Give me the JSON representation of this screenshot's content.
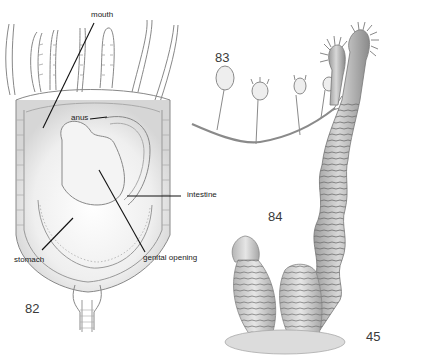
{
  "figure": {
    "background": "#ffffff",
    "ink_color": "#555555"
  },
  "labels": {
    "mouth": "mouth",
    "anus": "anus",
    "intestine": "intestine",
    "stomach": "stomach",
    "genital_opening": "genital opening"
  },
  "figure_numbers": {
    "fig82": "82",
    "fig83": "83",
    "fig84": "84",
    "fig45": "45"
  }
}
